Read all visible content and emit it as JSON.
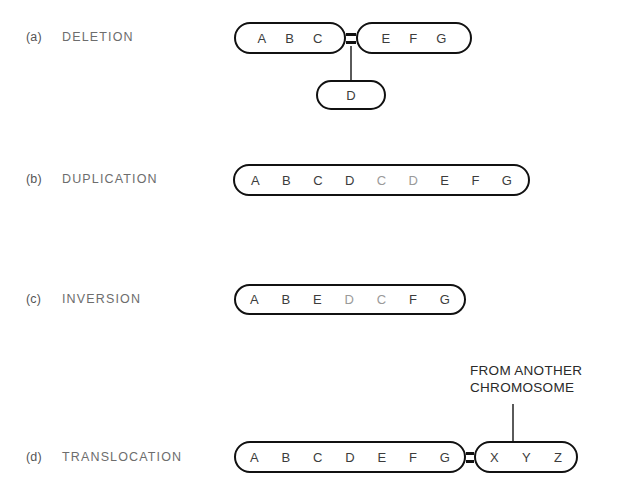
{
  "figure": {
    "background_color": "#ffffff",
    "outline_color": "#111111",
    "label_color": "#6d6d6d",
    "gene_color": "#3c3c3c",
    "faint_gene_color": "#9a9a9a"
  },
  "rows": [
    {
      "key": "deletion",
      "letter": "(a)",
      "label": "DELETION",
      "chromosomes": [
        {
          "name": "deletion-left-arm",
          "genes": [
            "A",
            "B",
            "C"
          ],
          "faint": [
            false,
            false,
            false
          ]
        },
        {
          "name": "deletion-right-arm",
          "genes": [
            "E",
            "F",
            "G"
          ],
          "faint": [
            false,
            false,
            false
          ]
        },
        {
          "name": "deleted-fragment",
          "genes": [
            "D"
          ],
          "faint": [
            false
          ]
        }
      ]
    },
    {
      "key": "duplication",
      "letter": "(b)",
      "label": "DUPLICATION",
      "chromosomes": [
        {
          "name": "duplication-chromosome",
          "genes": [
            "A",
            "B",
            "C",
            "D",
            "C",
            "D",
            "E",
            "F",
            "G"
          ],
          "faint": [
            false,
            false,
            false,
            false,
            true,
            true,
            false,
            false,
            false
          ]
        }
      ]
    },
    {
      "key": "inversion",
      "letter": "(c)",
      "label": "INVERSION",
      "chromosomes": [
        {
          "name": "inversion-chromosome",
          "genes": [
            "A",
            "B",
            "E",
            "D",
            "C",
            "F",
            "G"
          ],
          "faint": [
            false,
            false,
            false,
            true,
            true,
            false,
            false
          ]
        }
      ]
    },
    {
      "key": "translocation",
      "letter": "(d)",
      "label": "TRANSLOCATION",
      "chromosomes": [
        {
          "name": "translocation-main-chromosome",
          "genes": [
            "A",
            "B",
            "C",
            "D",
            "E",
            "F",
            "G"
          ],
          "faint": [
            false,
            false,
            false,
            false,
            false,
            false,
            false
          ]
        },
        {
          "name": "translocation-foreign-segment",
          "genes": [
            "X",
            "Y",
            "Z"
          ],
          "faint": [
            false,
            false,
            false
          ]
        }
      ],
      "annotation": {
        "line1": "FROM ANOTHER",
        "line2": "CHROMOSOME"
      }
    }
  ]
}
